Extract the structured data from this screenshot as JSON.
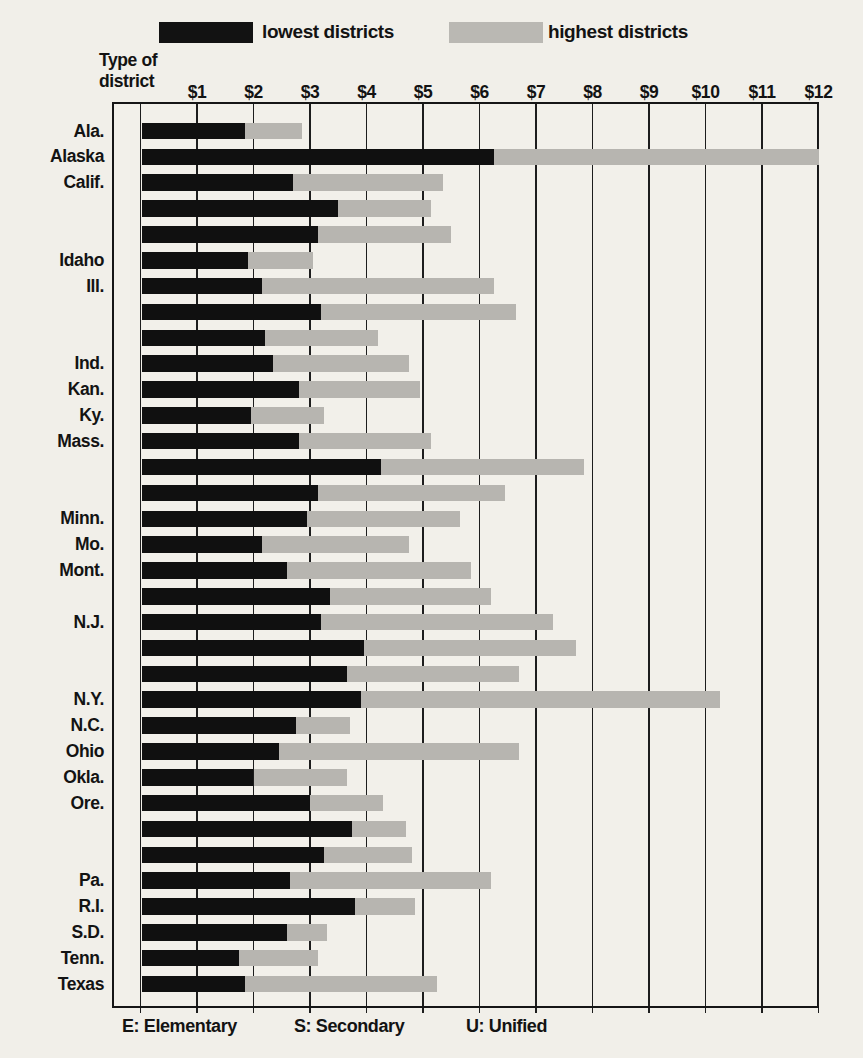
{
  "legend": {
    "lowest_label": "lowest districts",
    "highest_label": "highest districts"
  },
  "axis_header": {
    "line1": "Type of",
    "line2": "district"
  },
  "footer": {
    "e": "E: Elementary",
    "s": "S: Secondary",
    "u": "U: Unified"
  },
  "colors": {
    "lowest_bar": "#101010",
    "highest_bar": "#b7b5b0",
    "background": "#f1efe9",
    "line": "#1d1d1d"
  },
  "chart_data": {
    "type": "bar",
    "orientation": "horizontal",
    "grid": true,
    "legend_position": "top",
    "xlim": [
      0,
      12
    ],
    "x_tick_labels": [
      "$1",
      "$2",
      "$3",
      "$4",
      "$5",
      "$6",
      "$7",
      "$8",
      "$9",
      "$10",
      "$11",
      "$12"
    ],
    "series_names": [
      "lowest districts",
      "highest districts"
    ],
    "district_type_key": {
      "E": "Elementary",
      "S": "Secondary",
      "U": "Unified"
    },
    "rows": [
      {
        "state": "Ala.",
        "type": "U",
        "lowest": 1.85,
        "highest": 2.85
      },
      {
        "state": "Alaska",
        "type": "U",
        "lowest": 6.25,
        "highest": 12.0
      },
      {
        "state": "Calif.",
        "type": "E",
        "lowest": 2.7,
        "highest": 5.35
      },
      {
        "state": "",
        "type": "S",
        "lowest": 3.5,
        "highest": 5.15
      },
      {
        "state": "",
        "type": "U",
        "lowest": 3.15,
        "highest": 5.5
      },
      {
        "state": "Idaho",
        "type": "U",
        "lowest": 1.9,
        "highest": 3.05
      },
      {
        "state": "Ill.",
        "type": "E",
        "lowest": 2.15,
        "highest": 6.25
      },
      {
        "state": "",
        "type": "S",
        "lowest": 3.2,
        "highest": 6.65
      },
      {
        "state": "",
        "type": "U",
        "lowest": 2.2,
        "highest": 4.2
      },
      {
        "state": "Ind.",
        "type": "U",
        "lowest": 2.35,
        "highest": 4.75
      },
      {
        "state": "Kan.",
        "type": "U",
        "lowest": 2.8,
        "highest": 4.95
      },
      {
        "state": "Ky.",
        "type": "U",
        "lowest": 1.95,
        "highest": 3.25
      },
      {
        "state": "Mass.",
        "type": "E",
        "lowest": 2.8,
        "highest": 5.15
      },
      {
        "state": "",
        "type": "S",
        "lowest": 4.25,
        "highest": 7.85
      },
      {
        "state": "",
        "type": "U",
        "lowest": 3.15,
        "highest": 6.45
      },
      {
        "state": "Minn.",
        "type": "U",
        "lowest": 2.95,
        "highest": 5.65
      },
      {
        "state": "Mo.",
        "type": "U",
        "lowest": 2.15,
        "highest": 4.75
      },
      {
        "state": "Mont.",
        "type": "E",
        "lowest": 2.6,
        "highest": 5.85
      },
      {
        "state": "",
        "type": "S",
        "lowest": 3.35,
        "highest": 6.2
      },
      {
        "state": "N.J.",
        "type": "E",
        "lowest": 3.2,
        "highest": 7.3
      },
      {
        "state": "",
        "type": "S",
        "lowest": 3.95,
        "highest": 7.7
      },
      {
        "state": "",
        "type": "U",
        "lowest": 3.65,
        "highest": 6.7
      },
      {
        "state": "N.Y.",
        "type": "U",
        "lowest": 3.9,
        "highest": 10.25
      },
      {
        "state": "N.C.",
        "type": "U",
        "lowest": 2.75,
        "highest": 3.7
      },
      {
        "state": "Ohio",
        "type": "U",
        "lowest": 2.45,
        "highest": 6.7
      },
      {
        "state": "Okla.",
        "type": "U",
        "lowest": 2.0,
        "highest": 3.65
      },
      {
        "state": "Ore.",
        "type": "E*",
        "lowest": 3.0,
        "highest": 4.3
      },
      {
        "state": "",
        "type": "S*",
        "lowest": 3.75,
        "highest": 4.7
      },
      {
        "state": "",
        "type": "U",
        "lowest": 3.25,
        "highest": 4.8
      },
      {
        "state": "Pa.",
        "type": "U",
        "lowest": 2.65,
        "highest": 6.2
      },
      {
        "state": "R.I.",
        "type": "U*",
        "lowest": 3.8,
        "highest": 4.85
      },
      {
        "state": "S.D.",
        "type": "U",
        "lowest": 2.6,
        "highest": 3.3
      },
      {
        "state": "Tenn.",
        "type": "U",
        "lowest": 1.75,
        "highest": 3.15
      },
      {
        "state": "Texas",
        "type": "U",
        "lowest": 1.85,
        "highest": 5.25
      }
    ]
  }
}
